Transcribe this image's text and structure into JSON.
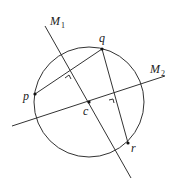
{
  "diagram": {
    "title": "",
    "circle": {
      "cx": 89,
      "cy": 102,
      "r": 55
    },
    "points": [
      {
        "id": "p",
        "label": "p",
        "x": 35,
        "y": 94,
        "lx": 23,
        "ly": 100
      },
      {
        "id": "q",
        "label": "q",
        "x": 102,
        "y": 49,
        "lx": 99,
        "ly": 42
      },
      {
        "id": "r",
        "label": "r",
        "x": 128,
        "y": 143,
        "lx": 131,
        "ly": 152
      },
      {
        "id": "c",
        "label": "c",
        "x": 89,
        "y": 102,
        "lx": 83,
        "ly": 115
      }
    ],
    "lines": {
      "M1": {
        "label": "M",
        "sub": "1",
        "x1": 45,
        "y1": 26,
        "x2": 131,
        "y2": 178,
        "lx": 50,
        "ly": 25
      },
      "M2": {
        "label": "M",
        "sub": "2",
        "x1": 12,
        "y1": 126,
        "x2": 165,
        "y2": 76,
        "lx": 150,
        "ly": 73
      }
    },
    "segments": [
      {
        "id": "pq",
        "from": "p",
        "to": "q"
      },
      {
        "id": "qr",
        "from": "q",
        "to": "r"
      }
    ],
    "colors": {
      "stroke": "#333333",
      "point": "#111111",
      "text": "#222222"
    }
  }
}
